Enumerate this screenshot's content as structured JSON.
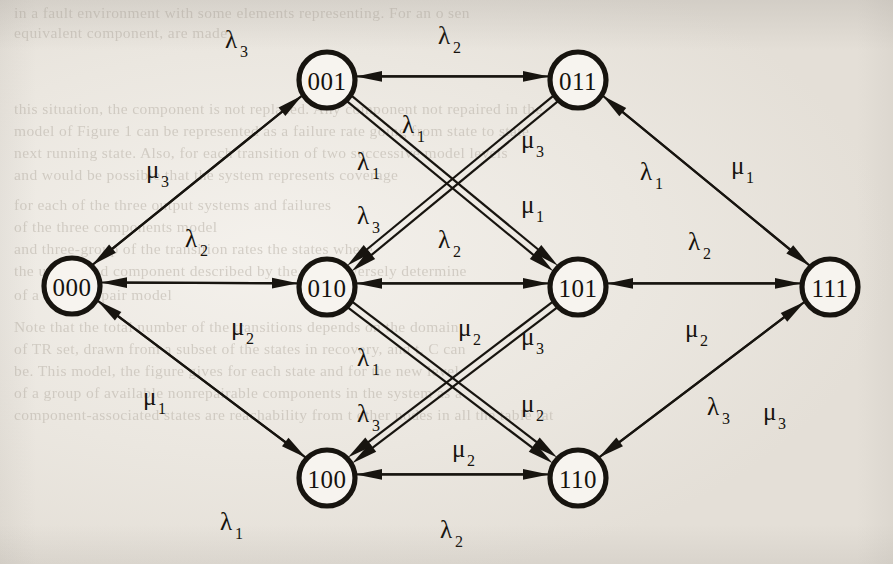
{
  "figure": {
    "type": "state-transition-diagram",
    "kind": "markov-chain",
    "node_radius": 28,
    "colors": {
      "ink": "#17140f",
      "paper": "#ebe7e0",
      "bleed_text": "#b9b2a8"
    },
    "nodes": [
      {
        "id": "000",
        "label": "000",
        "x": 72,
        "y": 286
      },
      {
        "id": "001",
        "label": "001",
        "x": 327,
        "y": 80
      },
      {
        "id": "010",
        "label": "010",
        "x": 327,
        "y": 287
      },
      {
        "id": "011",
        "label": "011",
        "x": 578,
        "y": 80
      },
      {
        "id": "100",
        "label": "100",
        "x": 327,
        "y": 478
      },
      {
        "id": "101",
        "label": "101",
        "x": 578,
        "y": 287
      },
      {
        "id": "110",
        "label": "110",
        "x": 578,
        "y": 478
      },
      {
        "id": "111",
        "label": "111",
        "x": 830,
        "y": 287
      }
    ],
    "edges": [
      {
        "from": "000",
        "to": "001",
        "rate": "λ",
        "sub": "3",
        "label": "λ3",
        "lx": 225,
        "ly": 48,
        "crossing": false
      },
      {
        "from": "001",
        "to": "000",
        "rate": "μ",
        "sub": "3",
        "label": "μ3",
        "lx": 146,
        "ly": 178,
        "crossing": false
      },
      {
        "from": "000",
        "to": "010",
        "rate": "λ",
        "sub": "2",
        "label": "λ2",
        "lx": 185,
        "ly": 247,
        "crossing": false
      },
      {
        "from": "010",
        "to": "000",
        "rate": "μ",
        "sub": "2",
        "label": "μ2",
        "lx": 231,
        "ly": 335,
        "crossing": false
      },
      {
        "from": "000",
        "to": "100",
        "rate": "λ",
        "sub": "1",
        "label": "λ1",
        "lx": 220,
        "ly": 530,
        "crossing": false
      },
      {
        "from": "100",
        "to": "000",
        "rate": "μ",
        "sub": "1",
        "label": "μ1",
        "lx": 143,
        "ly": 405,
        "crossing": false
      },
      {
        "from": "001",
        "to": "011",
        "rate": "λ",
        "sub": "2",
        "label": "λ2",
        "lx": 438,
        "ly": 44,
        "crossing": false
      },
      {
        "from": "011",
        "to": "001",
        "rate": "λ",
        "sub": "1",
        "label": "λ1",
        "lx": 402,
        "ly": 133,
        "crossing": true
      },
      {
        "from": "001",
        "to": "101",
        "rate": "λ",
        "sub": "1",
        "label": "λ1",
        "lx": 357,
        "ly": 170,
        "crossing": true
      },
      {
        "from": "001",
        "to": "101",
        "rate": "λ",
        "sub": "3",
        "label": "λ3",
        "lx": 357,
        "ly": 224,
        "crossing": true
      },
      {
        "from": "011",
        "to": "010",
        "rate": "μ",
        "sub": "3",
        "label": "μ3",
        "lx": 521,
        "ly": 148,
        "crossing": true
      },
      {
        "from": "011",
        "to": "010",
        "rate": "μ",
        "sub": "1",
        "label": "μ1",
        "lx": 521,
        "ly": 213,
        "crossing": true
      },
      {
        "from": "011",
        "to": "111",
        "rate": "λ",
        "sub": "1",
        "label": "λ1",
        "lx": 640,
        "ly": 180,
        "crossing": false
      },
      {
        "from": "111",
        "to": "011",
        "rate": "μ",
        "sub": "1",
        "label": "μ1",
        "lx": 731,
        "ly": 174,
        "crossing": false
      },
      {
        "from": "010",
        "to": "101",
        "rate": "λ",
        "sub": "2",
        "label": "λ2",
        "lx": 438,
        "ly": 248,
        "crossing": false
      },
      {
        "from": "101",
        "to": "010",
        "rate": "μ",
        "sub": "2",
        "label": "μ2",
        "lx": 458,
        "ly": 336,
        "crossing": false
      },
      {
        "from": "010",
        "to": "110",
        "rate": "λ",
        "sub": "1",
        "label": "λ1",
        "lx": 357,
        "ly": 366,
        "crossing": true
      },
      {
        "from": "010",
        "to": "110",
        "rate": "λ",
        "sub": "3",
        "label": "λ3",
        "lx": 357,
        "ly": 422,
        "crossing": true
      },
      {
        "from": "101",
        "to": "100",
        "rate": "μ",
        "sub": "3",
        "label": "μ3",
        "lx": 521,
        "ly": 345,
        "crossing": true
      },
      {
        "from": "101",
        "to": "100",
        "rate": "μ",
        "sub": "2",
        "label": "μ2",
        "lx": 521,
        "ly": 412,
        "crossing": true
      },
      {
        "from": "101",
        "to": "111",
        "rate": "λ",
        "sub": "2",
        "label": "λ2",
        "lx": 688,
        "ly": 250,
        "crossing": false
      },
      {
        "from": "111",
        "to": "101",
        "rate": "μ",
        "sub": "2",
        "label": "μ2",
        "lx": 685,
        "ly": 337,
        "crossing": false
      },
      {
        "from": "100",
        "to": "110",
        "rate": "λ",
        "sub": "2",
        "label": "λ2",
        "lx": 440,
        "ly": 538,
        "crossing": false
      },
      {
        "from": "110",
        "to": "100",
        "rate": "μ",
        "sub": "2",
        "label": "μ2",
        "lx": 452,
        "ly": 457,
        "crossing": false
      },
      {
        "from": "110",
        "to": "111",
        "rate": "λ",
        "sub": "3",
        "label": "λ3",
        "lx": 707,
        "ly": 415,
        "crossing": false
      },
      {
        "from": "111",
        "to": "110",
        "rate": "μ",
        "sub": "3",
        "label": "μ3",
        "lx": 763,
        "ly": 420,
        "crossing": false
      }
    ],
    "bleed_text": [
      {
        "text": "in a fault environment with some elements representing. For an o sen",
        "x": 14,
        "y": 4
      },
      {
        "text": "equivalent component, are made",
        "x": 14,
        "y": 24
      },
      {
        "text": "this situation, the component is not replaced. Any component not repaired  in the",
        "x": 14,
        "y": 100
      },
      {
        "text": "model of Figure 1 can be represented as a failure rate going from state to state",
        "x": 14,
        "y": 122
      },
      {
        "text": "next running state. Also, for each transition of two successive model levels",
        "x": 14,
        "y": 144
      },
      {
        "text": "and would be possible that the system represents coverage",
        "x": 14,
        "y": 166
      },
      {
        "text": "for each of the three output systems and failures",
        "x": 14,
        "y": 196
      },
      {
        "text": "of the three components model",
        "x": 14,
        "y": 218
      },
      {
        "text": "and three-group of the transition rates the states where",
        "x": 14,
        "y": 240
      },
      {
        "text": "the unrepaired component described by the state diversely determine",
        "x": 14,
        "y": 262
      },
      {
        "text": "of a single-repair model",
        "x": 14,
        "y": 286
      },
      {
        "text": "Note that the total number of the transitions depends on the domain",
        "x": 14,
        "y": 318
      },
      {
        "text": "of TR set, drawn from a subset of the states in recovery, and t, C can",
        "x": 14,
        "y": 340
      },
      {
        "text": "be. This model, the figure gives for each state and for the new level",
        "x": 14,
        "y": 362
      },
      {
        "text": "of a group of available nonrepairable components in the system as a",
        "x": 14,
        "y": 384
      },
      {
        "text": "component-associated states are reachability from t other nodes in all the table rat",
        "x": 14,
        "y": 406
      }
    ]
  }
}
